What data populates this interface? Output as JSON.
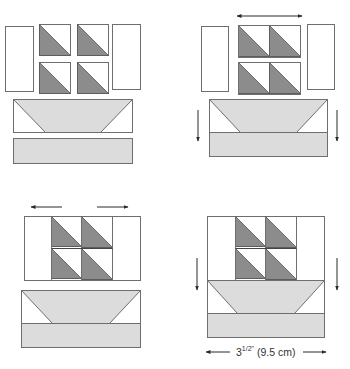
{
  "colors": {
    "stroke": "#6e6e6e",
    "dark_triangle": "#8c8c8c",
    "light_fabric": "#dcdcdc",
    "background_fabric": "#ffffff",
    "arrow": "#2a2a2a"
  },
  "dimension_label": {
    "text": "3¹/2\" (9.5 cm)",
    "whole": "3",
    "frac": "1/2\"",
    "metric": "(9.5 cm)"
  },
  "steps": [
    {
      "id": "step-1",
      "description": "Separate pieces: two side rectangles, four half-square triangle units, boat unit and water strip",
      "side_rects": [
        {
          "x": 5,
          "y": 26,
          "w": 28,
          "h": 65
        },
        {
          "x": 112,
          "y": 24,
          "w": 28,
          "h": 65
        }
      ],
      "hst_units": [
        {
          "x": 39,
          "y": 24,
          "s": 31
        },
        {
          "x": 77,
          "y": 24,
          "s": 31
        },
        {
          "x": 39,
          "y": 62,
          "s": 31
        },
        {
          "x": 77,
          "y": 62,
          "s": 31
        }
      ],
      "boat": {
        "x": 13,
        "y": 99,
        "w": 119,
        "h": 33,
        "inset": 32
      },
      "water": {
        "x": 13,
        "y": 138,
        "w": 119,
        "h": 25
      },
      "arrows": []
    },
    {
      "id": "step-2",
      "description": "Join half-square triangles in pairs; join boat to water strip",
      "side_rects": [
        {
          "x": 201,
          "y": 26,
          "w": 27,
          "h": 65
        },
        {
          "x": 307,
          "y": 24,
          "w": 27,
          "h": 65
        }
      ],
      "hst_units": [
        {
          "x": 238,
          "y": 25,
          "s": 31
        },
        {
          "x": 269,
          "y": 25,
          "s": 31
        },
        {
          "x": 238,
          "y": 62,
          "s": 31
        },
        {
          "x": 269,
          "y": 62,
          "s": 31
        }
      ],
      "hst_rows": [
        {
          "x": 238,
          "y": 25,
          "w": 62,
          "h": 32
        },
        {
          "x": 238,
          "y": 62,
          "w": 62,
          "h": 32
        }
      ],
      "boat": {
        "x": 209,
        "y": 99,
        "w": 118,
        "h": 33,
        "inset": 31
      },
      "water": {
        "x": 209,
        "y": 132,
        "w": 118,
        "h": 24
      },
      "arrows": [
        {
          "type": "double-h",
          "x1": 237,
          "x2": 302,
          "y": 16
        },
        {
          "type": "down",
          "x": 198,
          "y1": 110,
          "y2": 141
        },
        {
          "type": "down",
          "x": 337,
          "y1": 110,
          "y2": 141
        }
      ]
    },
    {
      "id": "step-3",
      "description": "Sail section sewn with side rectangles; boat unit completed",
      "block": {
        "x": 24,
        "y": 216,
        "w": 116,
        "h": 64
      },
      "inner_lines_x": [
        51,
        81,
        112
      ],
      "hst_units": [
        {
          "x": 51,
          "y": 216,
          "s": 30
        },
        {
          "x": 81,
          "y": 216,
          "s": 31
        },
        {
          "x": 51,
          "y": 248,
          "s": 30
        },
        {
          "x": 81,
          "y": 248,
          "s": 31
        }
      ],
      "boat": {
        "x": 21,
        "y": 290,
        "w": 119,
        "h": 33,
        "inset": 31
      },
      "water": {
        "x": 21,
        "y": 323,
        "w": 119,
        "h": 24
      },
      "arrows": [
        {
          "type": "left",
          "x1": 31,
          "x2": 62,
          "y": 207
        },
        {
          "type": "right",
          "x1": 97,
          "x2": 128,
          "y": 207
        }
      ]
    },
    {
      "id": "step-4",
      "description": "Join sail section to boat unit to complete the block",
      "block": {
        "x": 207,
        "y": 216,
        "w": 117,
        "h": 64
      },
      "inner_lines_x": [
        235,
        265,
        296
      ],
      "hst_units": [
        {
          "x": 235,
          "y": 216,
          "s": 30
        },
        {
          "x": 265,
          "y": 216,
          "s": 31
        },
        {
          "x": 235,
          "y": 248,
          "s": 30
        },
        {
          "x": 265,
          "y": 248,
          "s": 31
        }
      ],
      "boat": {
        "x": 207,
        "y": 280,
        "w": 117,
        "h": 33,
        "inset": 30
      },
      "water": {
        "x": 207,
        "y": 313,
        "w": 117,
        "h": 24
      },
      "arrows": [
        {
          "type": "down",
          "x": 197,
          "y1": 258,
          "y2": 290
        },
        {
          "type": "down",
          "x": 337,
          "y1": 258,
          "y2": 290
        },
        {
          "type": "left",
          "x1": 206,
          "x2": 230,
          "y": 352
        },
        {
          "type": "right",
          "x1": 303,
          "x2": 326,
          "y": 352
        }
      ]
    }
  ]
}
